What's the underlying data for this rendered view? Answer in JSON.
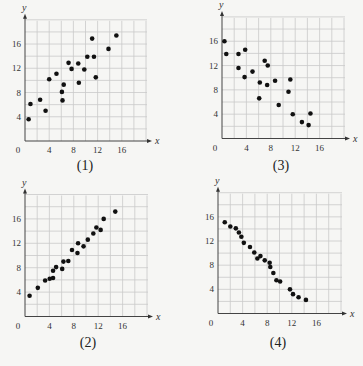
{
  "chart_data": [
    {
      "type": "scatter",
      "title": "",
      "caption": "(1)",
      "xlabel": "x",
      "ylabel": "y",
      "xlim": [
        0,
        20
      ],
      "ylim": [
        0,
        20
      ],
      "xticks": [
        0,
        4,
        8,
        12,
        16
      ],
      "yticks": [
        4,
        8,
        12,
        16
      ],
      "grid": true,
      "grid_step": 2,
      "points": [
        [
          0.6,
          3.6
        ],
        [
          0.9,
          6.1
        ],
        [
          2.5,
          6.8
        ],
        [
          3.4,
          5.0
        ],
        [
          4.0,
          10.2
        ],
        [
          5.2,
          11.1
        ],
        [
          6.1,
          8.1
        ],
        [
          6.2,
          6.7
        ],
        [
          6.4,
          9.3
        ],
        [
          7.2,
          12.9
        ],
        [
          7.7,
          11.9
        ],
        [
          8.8,
          12.8
        ],
        [
          8.9,
          9.6
        ],
        [
          9.8,
          11.8
        ],
        [
          10.3,
          13.9
        ],
        [
          11.1,
          16.9
        ],
        [
          11.4,
          13.9
        ],
        [
          11.7,
          10.5
        ],
        [
          13.8,
          15.2
        ],
        [
          15.1,
          17.4
        ]
      ]
    },
    {
      "type": "scatter",
      "title": "",
      "caption": "(3)",
      "xlabel": "x",
      "ylabel": "y",
      "xlim": [
        0,
        20
      ],
      "ylim": [
        0,
        20
      ],
      "xticks": [
        0,
        4,
        8,
        12,
        16
      ],
      "yticks": [
        4,
        8,
        12,
        16
      ],
      "grid": true,
      "grid_step": 2,
      "points": [
        [
          0.4,
          16.0
        ],
        [
          0.7,
          13.9
        ],
        [
          2.7,
          13.9
        ],
        [
          3.8,
          14.6
        ],
        [
          2.7,
          11.6
        ],
        [
          3.7,
          10.1
        ],
        [
          5.0,
          11.0
        ],
        [
          7.0,
          12.8
        ],
        [
          7.5,
          12.0
        ],
        [
          6.2,
          9.2
        ],
        [
          6.1,
          6.6
        ],
        [
          7.4,
          8.8
        ],
        [
          8.7,
          9.5
        ],
        [
          11.2,
          9.7
        ],
        [
          10.9,
          7.7
        ],
        [
          9.3,
          5.5
        ],
        [
          11.6,
          4.0
        ],
        [
          13.1,
          2.7
        ],
        [
          14.2,
          2.2
        ],
        [
          14.5,
          4.1
        ]
      ]
    },
    {
      "type": "scatter",
      "title": "",
      "caption": "(2)",
      "xlabel": "x",
      "ylabel": "y",
      "xlim": [
        0,
        20
      ],
      "ylim": [
        0,
        20
      ],
      "xticks": [
        0,
        4,
        8,
        12,
        16
      ],
      "yticks": [
        4,
        8,
        12,
        16
      ],
      "grid": true,
      "grid_step": 2,
      "points": [
        [
          0.75,
          3.4
        ],
        [
          2.1,
          4.7
        ],
        [
          3.3,
          5.9
        ],
        [
          4.05,
          6.2
        ],
        [
          4.6,
          6.3
        ],
        [
          4.6,
          7.5
        ],
        [
          5.1,
          8.1
        ],
        [
          6.1,
          7.8
        ],
        [
          6.3,
          9.0
        ],
        [
          7.1,
          9.1
        ],
        [
          7.7,
          10.9
        ],
        [
          8.6,
          10.4
        ],
        [
          8.7,
          12.0
        ],
        [
          9.6,
          11.5
        ],
        [
          10.3,
          12.6
        ],
        [
          11.2,
          13.6
        ],
        [
          11.7,
          14.6
        ],
        [
          12.4,
          14.2
        ],
        [
          12.9,
          16.0
        ],
        [
          14.8,
          17.2
        ]
      ]
    },
    {
      "type": "scatter",
      "title": "",
      "caption": "(4)",
      "xlabel": "x",
      "ylabel": "y",
      "xlim": [
        0,
        20
      ],
      "ylim": [
        0,
        20
      ],
      "xticks": [
        0,
        4,
        8,
        12,
        16
      ],
      "yticks": [
        4,
        8,
        12,
        16
      ],
      "grid": true,
      "grid_step": 2,
      "points": [
        [
          1.1,
          15.1
        ],
        [
          2.0,
          14.4
        ],
        [
          2.9,
          14.1
        ],
        [
          3.4,
          13.4
        ],
        [
          3.8,
          12.7
        ],
        [
          4.2,
          11.7
        ],
        [
          5.2,
          11.0
        ],
        [
          5.9,
          10.1
        ],
        [
          6.9,
          9.5
        ],
        [
          6.4,
          9.1
        ],
        [
          7.6,
          8.8
        ],
        [
          8.4,
          8.4
        ],
        [
          8.5,
          7.7
        ],
        [
          9.0,
          6.7
        ],
        [
          9.5,
          5.5
        ],
        [
          10.1,
          5.3
        ],
        [
          11.7,
          4.0
        ],
        [
          12.2,
          3.2
        ],
        [
          13.1,
          2.7
        ],
        [
          14.3,
          2.25
        ]
      ]
    }
  ]
}
